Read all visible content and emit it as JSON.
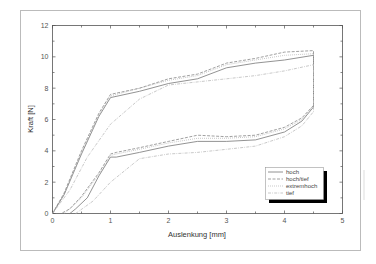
{
  "chart_data": {
    "type": "line",
    "title": "",
    "xlabel": "Auslenkung [mm]",
    "ylabel": "Kraft [N]",
    "xlim": [
      0,
      5
    ],
    "ylim": [
      0,
      12
    ],
    "xticks": [
      "0",
      "1",
      "2",
      "3",
      "4",
      "5"
    ],
    "yticks": [
      "0",
      "2",
      "4",
      "6",
      "8",
      "10",
      "12"
    ],
    "grid": false,
    "legend_position": "lower right",
    "series": [
      {
        "name": "hoch",
        "style": "solid",
        "color": "#777777",
        "x": [
          0,
          0.2,
          0.5,
          0.8,
          1.0,
          1.5,
          2.0,
          2.5,
          3.0,
          3.5,
          4.0,
          4.5,
          4.5,
          4.3,
          4.0,
          3.5,
          3.0,
          2.5,
          2.0,
          1.5,
          1.1,
          1.0,
          0.8,
          0.6,
          0.4,
          0.3
        ],
        "y": [
          0,
          1.2,
          3.8,
          6.2,
          7.4,
          7.8,
          8.3,
          8.6,
          9.3,
          9.6,
          9.8,
          10.1,
          6.8,
          5.9,
          5.2,
          4.7,
          4.6,
          4.6,
          4.3,
          3.9,
          3.6,
          3.6,
          2.4,
          1.0,
          0.3,
          0
        ]
      },
      {
        "name": "hoch/tief",
        "style": "dashed",
        "color": "#888888",
        "x": [
          0,
          0.2,
          0.5,
          0.8,
          1.0,
          1.5,
          2.0,
          2.5,
          3.0,
          3.5,
          4.0,
          4.5,
          4.5,
          4.3,
          4.0,
          3.5,
          3.0,
          2.5,
          2.0,
          1.5,
          1.1,
          1.0,
          0.8,
          0.5,
          0.3,
          0.15
        ],
        "y": [
          0,
          1.3,
          4.0,
          6.4,
          7.6,
          8.0,
          8.6,
          8.9,
          9.6,
          9.9,
          10.3,
          10.4,
          6.9,
          6.1,
          5.5,
          5.0,
          4.9,
          5.0,
          4.6,
          4.2,
          3.9,
          3.8,
          2.6,
          1.1,
          0.3,
          0
        ]
      },
      {
        "name": "extremhoch",
        "style": "dotted",
        "color": "#aaaaaa",
        "x": [
          0,
          0.2,
          0.5,
          0.8,
          1.0,
          1.5,
          2.0,
          2.5,
          3.0,
          3.5,
          4.0,
          4.5,
          4.5,
          4.3,
          4.0,
          3.5,
          3.0,
          2.5,
          2.0,
          1.5,
          1.1,
          1.0,
          0.8,
          0.5,
          0.3,
          0.2
        ],
        "y": [
          0,
          1.2,
          3.9,
          6.3,
          7.5,
          8.0,
          8.5,
          8.8,
          9.5,
          9.8,
          10.1,
          10.2,
          6.9,
          6.0,
          5.4,
          4.9,
          4.8,
          4.8,
          4.5,
          4.1,
          3.8,
          3.7,
          2.5,
          1.0,
          0.3,
          0
        ]
      },
      {
        "name": "tief",
        "style": "dash-dot",
        "color": "#bbbbbb",
        "x": [
          0,
          0.3,
          0.6,
          1.0,
          1.5,
          2.0,
          2.5,
          3.0,
          3.5,
          4.0,
          4.5,
          4.5,
          4.3,
          4.0,
          3.5,
          3.0,
          2.5,
          2.0,
          1.5,
          1.0,
          0.7,
          0.4
        ],
        "y": [
          0,
          1.5,
          3.6,
          5.7,
          7.3,
          8.2,
          8.4,
          8.6,
          8.8,
          9.1,
          9.5,
          6.5,
          5.6,
          4.9,
          4.3,
          4.1,
          3.9,
          3.8,
          3.5,
          2.0,
          0.8,
          0
        ]
      }
    ]
  },
  "legend": {
    "items": [
      {
        "label": "hoch",
        "style": "solid"
      },
      {
        "label": "hoch/tief",
        "style": "dashed"
      },
      {
        "label": "extremhoch",
        "style": "dotted"
      },
      {
        "label": "tief",
        "style": "dash-dot"
      }
    ]
  },
  "axes": {
    "xlabel": "Auslenkung [mm]",
    "ylabel": "Kraft [N]",
    "xticks": [
      "0",
      "1",
      "2",
      "3",
      "4",
      "5"
    ],
    "yticks": [
      "0",
      "2",
      "4",
      "6",
      "8",
      "10",
      "12"
    ]
  }
}
